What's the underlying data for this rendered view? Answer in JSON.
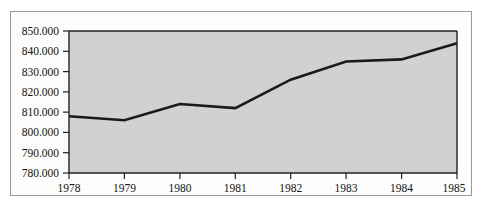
{
  "chart_data": {
    "type": "line",
    "title": "",
    "subtitle": "",
    "xlabel": "",
    "ylabel": "",
    "categories": [
      "1978",
      "1979",
      "1980",
      "1981",
      "1982",
      "1983",
      "1984",
      "1985"
    ],
    "x": [
      1978,
      1979,
      1980,
      1981,
      1982,
      1983,
      1984,
      1985
    ],
    "values": [
      808.0,
      806.0,
      814.0,
      812.0,
      826.0,
      835.0,
      836.0,
      844.0
    ],
    "series": [
      {
        "name": "series-1",
        "values": [
          808.0,
          806.0,
          814.0,
          812.0,
          826.0,
          835.0,
          836.0,
          844.0
        ]
      }
    ],
    "ylim": [
      780.0,
      850.0
    ],
    "xlim": [
      1978,
      1985
    ],
    "ytick_labels": [
      "850.000",
      "840.000",
      "830.000",
      "820.000",
      "810.000",
      "800.000",
      "790.000",
      "780.000"
    ],
    "ytick_values": [
      850,
      840,
      830,
      820,
      810,
      800,
      790,
      780
    ],
    "xtick_labels": [
      "1978",
      "1979",
      "1980",
      "1981",
      "1982",
      "1983",
      "1984",
      "1985"
    ],
    "grid": false,
    "legend": false,
    "legend_position": "none",
    "annotations": []
  },
  "style": {
    "plot_background": "#d3d3d3",
    "page_background": "#ffffff",
    "line_color": "#1b1b1b",
    "axis_color": "#222222",
    "frame_color": "#9a9a9a",
    "text_color": "#141414"
  }
}
